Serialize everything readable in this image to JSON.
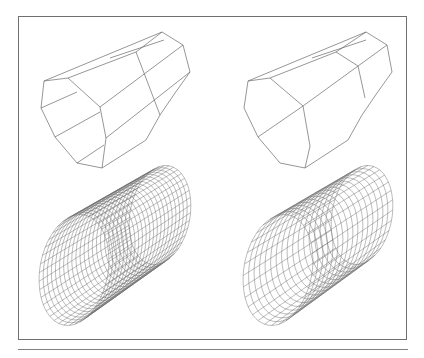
{
  "figure": {
    "panels": [
      {
        "id": "top-left",
        "description": "Coarse octagonal prism wireframe, longitudinal edges plus 2 horizontal seams on front face"
      },
      {
        "id": "top-right",
        "description": "Coarse octagonal prism wireframe, alternate subdivision"
      },
      {
        "id": "bottom-left",
        "description": "Refined cylindrical quad mesh, structured grid"
      },
      {
        "id": "bottom-right",
        "description": "Refined cylindrical quad mesh with irregular patch structure"
      }
    ],
    "colors": {
      "line": "#6a6a6a",
      "frame": "#707070",
      "background": "#ffffff"
    }
  }
}
